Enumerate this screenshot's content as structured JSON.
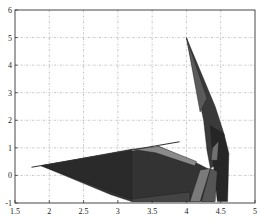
{
  "chart_data": {
    "type": "area",
    "subtype": "3d-surface-top-view",
    "title": "",
    "xlabel": "",
    "ylabel": "",
    "xlim": [
      1.5,
      5
    ],
    "ylim": [
      -1,
      6
    ],
    "grid": true,
    "legend": null,
    "x_ticks": [
      1.5,
      2,
      2.5,
      3,
      3.5,
      4,
      4.5,
      5
    ],
    "x_tick_labels": [
      "1.5",
      "2",
      "2.5",
      "3",
      "3.5",
      "4",
      "4.5",
      "5"
    ],
    "y_ticks": [
      -1,
      0,
      1,
      2,
      3,
      4,
      5,
      6
    ],
    "y_tick_labels": [
      "-1",
      "0",
      "1",
      "2",
      "3",
      "4",
      "5",
      "6"
    ],
    "colors": {
      "dark_face": "#2e2e2e",
      "mid_face": "#4a4a4a",
      "light_face": "#8a8a8a",
      "edge": "#1a1a1a",
      "grid": "#9a9a9a"
    },
    "polygons": [
      {
        "name": "main-sheet",
        "fill": "#333333",
        "points": [
          [
            1.88,
            0.35
          ],
          [
            3.6,
            1.05
          ],
          [
            4.15,
            0.45
          ],
          [
            4.35,
            0.2
          ],
          [
            4.4,
            -0.95
          ],
          [
            3.2,
            -0.95
          ],
          [
            2.9,
            -0.7
          ]
        ]
      },
      {
        "name": "rear-left-wedge",
        "fill": "#2a2a2a",
        "points": [
          [
            1.88,
            0.35
          ],
          [
            3.2,
            0.95
          ],
          [
            3.2,
            -0.85
          ]
        ]
      },
      {
        "name": "light-band",
        "fill": "#8a8a8a",
        "points": [
          [
            3.2,
            0.95
          ],
          [
            3.6,
            1.05
          ],
          [
            4.15,
            0.5
          ],
          [
            4.12,
            0.35
          ],
          [
            3.55,
            0.82
          ]
        ]
      },
      {
        "name": "spike",
        "fill": "#3a3a3a",
        "points": [
          [
            4.0,
            5.0
          ],
          [
            4.42,
            2.5
          ],
          [
            4.55,
            1.5
          ],
          [
            4.55,
            0.6
          ],
          [
            4.35,
            0.25
          ],
          [
            4.3,
            0.9
          ],
          [
            4.25,
            2.0
          ]
        ]
      },
      {
        "name": "spike-highlight",
        "fill": "#5a5a5a",
        "points": [
          [
            4.0,
            5.0
          ],
          [
            4.3,
            2.8
          ],
          [
            4.2,
            2.3
          ]
        ]
      },
      {
        "name": "right-column",
        "fill": "#262626",
        "points": [
          [
            4.35,
            1.8
          ],
          [
            4.55,
            1.5
          ],
          [
            4.62,
            0.8
          ],
          [
            4.6,
            -0.95
          ],
          [
            4.45,
            -0.95
          ],
          [
            4.4,
            0.2
          ]
        ]
      },
      {
        "name": "right-column-light",
        "fill": "#707070",
        "points": [
          [
            4.38,
            1.0
          ],
          [
            4.47,
            1.25
          ],
          [
            4.45,
            0.55
          ],
          [
            4.36,
            0.55
          ]
        ]
      },
      {
        "name": "front-light-strip",
        "fill": "#7a7a7a",
        "points": [
          [
            4.2,
            0.2
          ],
          [
            4.35,
            0.25
          ],
          [
            4.2,
            -0.95
          ],
          [
            4.05,
            -0.95
          ]
        ]
      },
      {
        "name": "front-mid-strip",
        "fill": "#555555",
        "points": [
          [
            4.35,
            0.25
          ],
          [
            4.45,
            0.15
          ],
          [
            4.42,
            -0.95
          ],
          [
            4.22,
            -0.95
          ]
        ]
      },
      {
        "name": "lower-band",
        "fill": "#444444",
        "points": [
          [
            3.2,
            -0.85
          ],
          [
            4.05,
            -0.6
          ],
          [
            4.05,
            -0.95
          ],
          [
            3.2,
            -0.95
          ]
        ]
      }
    ],
    "lines": [
      {
        "name": "ridge-line",
        "stroke": "#333333",
        "points": [
          [
            1.74,
            0.3
          ],
          [
            3.9,
            1.22
          ]
        ]
      }
    ],
    "peak": {
      "x": 4.0,
      "y": 5.0
    }
  }
}
